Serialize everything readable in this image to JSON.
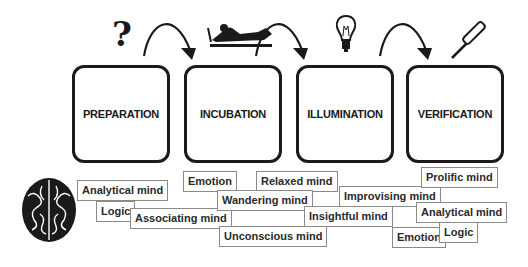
{
  "stages": [
    {
      "label": "PREPARATION",
      "icon": "question-mark-icon"
    },
    {
      "label": "INCUBATION",
      "icon": "person-resting-icon"
    },
    {
      "label": "ILLUMINATION",
      "icon": "lightbulb-icon"
    },
    {
      "label": "VERIFICATION",
      "icon": "screwdriver-icon"
    }
  ],
  "icons": {
    "question": "?",
    "brain": "brain-icon",
    "arrows": "curved-arrow-icon"
  },
  "tags": {
    "preparation": [
      "Analytical mind",
      "Logic",
      "Associating mind"
    ],
    "incubation": [
      "Emotion",
      "Relaxed mind",
      "Wandering mind",
      "Unconscious mind"
    ],
    "illumination": [
      "Improvising mind",
      "Insightful mind"
    ],
    "verification": [
      "Prolific mind",
      "Analytical mind",
      "Emotion",
      "Logic"
    ]
  }
}
